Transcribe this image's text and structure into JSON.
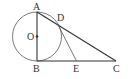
{
  "diagram": {
    "type": "geometry",
    "stroke_color": "#333333",
    "circle": {
      "label": "O",
      "cx": 37,
      "cy": 36.5,
      "r": 24.5
    },
    "points": {
      "A": {
        "label": "A",
        "x": 37,
        "y": 12
      },
      "B": {
        "label": "B",
        "x": 37,
        "y": 61
      },
      "C": {
        "label": "C",
        "x": 116,
        "y": 61
      },
      "D": {
        "label": "D",
        "x": 58,
        "y": 22
      },
      "E": {
        "label": "E",
        "x": 76.5,
        "y": 61
      },
      "O": {
        "label": "O",
        "x": 37,
        "y": 36.5
      }
    },
    "segments": [
      "AB",
      "BC",
      "AC",
      "DE"
    ]
  }
}
